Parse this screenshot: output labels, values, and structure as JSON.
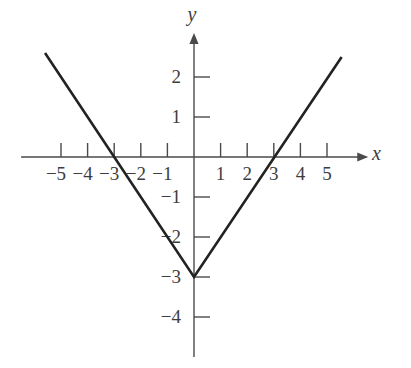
{
  "figure": {
    "background": "#ffffff",
    "axis_color": "#4a4a4a",
    "curve_color": "#222222",
    "label_color": "#3d3d3d"
  },
  "chart_data": {
    "type": "line",
    "title": "",
    "function": "y = |x| - 3",
    "xlabel": "x",
    "ylabel": "y",
    "x_range": [
      -6.5,
      6.55
    ],
    "y_range": [
      -5,
      3.1
    ],
    "x_ticks": [
      -5,
      -4,
      -3,
      -2,
      -1,
      1,
      2,
      3,
      4,
      5
    ],
    "y_ticks": [
      2,
      1,
      -1,
      -2,
      -3,
      -4
    ],
    "series": [
      {
        "name": "y = |x| - 3",
        "points": [
          [
            -5.6,
            2.6
          ],
          [
            0,
            -3
          ],
          [
            5.55,
            2.5
          ]
        ]
      }
    ],
    "vertex": [
      0,
      -3
    ],
    "x_intercepts": [
      -3,
      3
    ],
    "y_intercept": -3,
    "grid": false,
    "legend": false
  }
}
